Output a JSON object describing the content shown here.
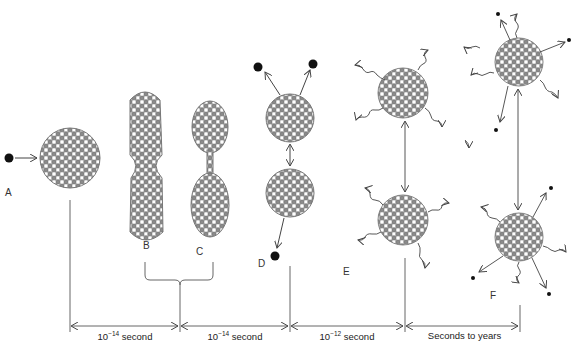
{
  "stages": [
    {
      "id": "A",
      "label": "A",
      "description": "Neutron approaches nucleus"
    },
    {
      "id": "B",
      "label": "B",
      "description": "Nucleus elongates"
    },
    {
      "id": "C",
      "label": "C",
      "description": "Nucleus necks into dumbbell"
    },
    {
      "id": "D",
      "label": "D",
      "description": "Fragments separate, prompt neutrons emitted"
    },
    {
      "id": "E",
      "label": "E",
      "description": "Fragments emit gamma rays"
    },
    {
      "id": "F",
      "label": "F",
      "description": "Fragments undergo beta decay"
    }
  ],
  "timeline": [
    {
      "base": "10",
      "exp": "−14",
      "unit": " second"
    },
    {
      "base": "10",
      "exp": "−14",
      "unit": " second"
    },
    {
      "base": "10",
      "exp": "−12",
      "unit": " second"
    },
    {
      "text": "Seconds to years"
    }
  ],
  "colors": {
    "line": "#555555",
    "neutral": "#ffffff",
    "proton": "#8a8a8a",
    "outline": "#666666",
    "dot": "#111111"
  }
}
